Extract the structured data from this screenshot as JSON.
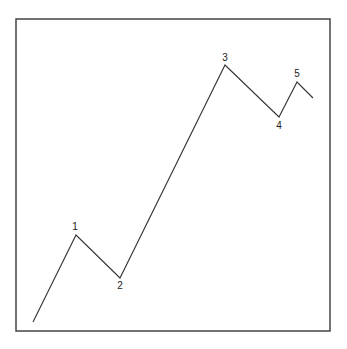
{
  "diagram": {
    "type": "elliott-wave-impulse",
    "border": {
      "x": 16,
      "y": 19,
      "width": 314,
      "height": 312,
      "color": "#444444"
    },
    "line_color": "#333333",
    "path_points": [
      {
        "x": 33,
        "y": 322
      },
      {
        "x": 76,
        "y": 235
      },
      {
        "x": 120,
        "y": 278
      },
      {
        "x": 225,
        "y": 65
      },
      {
        "x": 279,
        "y": 117
      },
      {
        "x": 297,
        "y": 82
      },
      {
        "x": 313,
        "y": 98
      }
    ],
    "wave_labels": [
      {
        "label": "1",
        "x": 75,
        "y": 230
      },
      {
        "label": "2",
        "x": 120,
        "y": 289
      },
      {
        "label": "3",
        "x": 225,
        "y": 61
      },
      {
        "label": "4",
        "x": 279,
        "y": 129
      },
      {
        "label": "5",
        "x": 297,
        "y": 77
      }
    ]
  }
}
